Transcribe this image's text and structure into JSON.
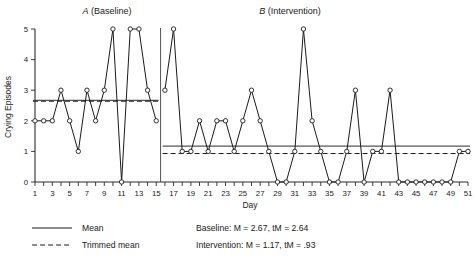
{
  "chart_data": {
    "type": "line",
    "title": "",
    "xlabel": "Day",
    "ylabel": "Crying Episodes",
    "xlim": [
      1,
      51
    ],
    "ylim": [
      0,
      5
    ],
    "grid": false,
    "x": [
      1,
      2,
      3,
      4,
      5,
      6,
      7,
      8,
      9,
      10,
      11,
      12,
      13,
      14,
      15,
      16,
      17,
      18,
      19,
      20,
      21,
      22,
      23,
      24,
      25,
      26,
      27,
      28,
      29,
      30,
      31,
      32,
      33,
      34,
      35,
      36,
      37,
      38,
      39,
      40,
      41,
      42,
      43,
      44,
      45,
      46,
      47,
      48,
      49,
      50,
      51
    ],
    "xtick_labels": [
      "1",
      "3",
      "5",
      "7",
      "9",
      "11",
      "13",
      "15",
      "17",
      "19",
      "21",
      "23",
      "25",
      "27",
      "29",
      "31",
      "33",
      "35",
      "37",
      "39",
      "41",
      "43",
      "45",
      "47",
      "49",
      "51"
    ],
    "xtick_values": [
      1,
      3,
      5,
      7,
      9,
      11,
      13,
      15,
      17,
      19,
      21,
      23,
      25,
      27,
      29,
      31,
      33,
      35,
      37,
      39,
      41,
      43,
      45,
      47,
      49,
      51
    ],
    "ytick_labels": [
      "0",
      "1",
      "2",
      "3",
      "4",
      "5"
    ],
    "ytick_values": [
      0,
      1,
      2,
      3,
      4,
      5
    ],
    "phase_divider_x": 15.5,
    "series": [
      {
        "name": "A (Baseline)",
        "phase": "A",
        "x": [
          1,
          2,
          3,
          4,
          5,
          6,
          7,
          8,
          9,
          10,
          11,
          12,
          13,
          14,
          15
        ],
        "values": [
          2,
          2,
          2,
          3,
          2,
          1,
          3,
          2,
          3,
          5,
          0,
          5,
          5,
          3,
          2
        ]
      },
      {
        "name": "B (Intervention)",
        "phase": "B",
        "x": [
          16,
          17,
          18,
          19,
          20,
          21,
          22,
          23,
          24,
          25,
          26,
          27,
          28,
          29,
          30,
          31,
          32,
          33,
          34,
          35,
          36,
          37,
          38,
          39,
          40,
          41,
          42,
          43,
          44,
          45,
          46,
          47,
          48,
          49,
          50,
          51
        ],
        "values": [
          3,
          5,
          1,
          1,
          2,
          1,
          2,
          2,
          1,
          2,
          3,
          2,
          1,
          0,
          0,
          1,
          5,
          2,
          1,
          0,
          0,
          1,
          3,
          0,
          1,
          1,
          3,
          0,
          0,
          0,
          0,
          0,
          0,
          0,
          1,
          1
        ]
      }
    ],
    "phases": [
      {
        "id": "A",
        "letter": "A",
        "label": "(Baseline)"
      },
      {
        "id": "B",
        "letter": "B",
        "label": "(Intervention)"
      }
    ],
    "reference_lines": [
      {
        "phase": "A",
        "kind": "mean",
        "value": 2.67,
        "style": "solid"
      },
      {
        "phase": "A",
        "kind": "trimmed_mean",
        "value": 2.64,
        "style": "dashed"
      },
      {
        "phase": "B",
        "kind": "mean",
        "value": 1.17,
        "style": "solid"
      },
      {
        "phase": "B",
        "kind": "trimmed_mean",
        "value": 0.93,
        "style": "dashed"
      }
    ],
    "legend": {
      "position": "bottom-left",
      "entries": [
        {
          "label": "Mean",
          "style": "solid"
        },
        {
          "label": "Trimmed mean",
          "style": "dashed"
        }
      ]
    },
    "annotations": [
      {
        "id": "baseline-stats",
        "text": "Baseline: M = 2.67, tM = 2.64"
      },
      {
        "id": "intervention-stats",
        "text": "Intervention: M = 1.17, tM = .93"
      }
    ]
  },
  "colors": {
    "ink": "#1a1a1a",
    "axis": "#2b2b2b",
    "mean": "#555555",
    "background": "#ffffff"
  }
}
